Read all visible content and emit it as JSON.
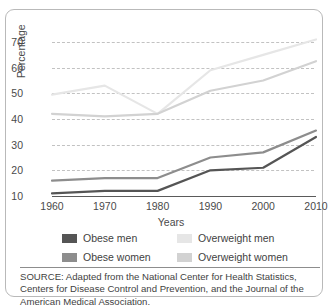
{
  "chart_data": {
    "type": "line",
    "title": "",
    "xlabel": "Years",
    "ylabel": "Percentage",
    "x": [
      1960,
      1970,
      1980,
      1990,
      2000,
      2010
    ],
    "xticklabels": [
      "1960",
      "1970",
      "1980",
      "1990",
      "2000",
      "2010"
    ],
    "yticklabels": [
      "70",
      "60",
      "50",
      "40",
      "30",
      "20",
      "10"
    ],
    "ylim": [
      10,
      73
    ],
    "xlim": [
      1960,
      2010
    ],
    "grid": "horizontal-dashed",
    "legend_position": "below-plot",
    "series": [
      {
        "name": "Obese men",
        "color": "#555555",
        "values": [
          11,
          12,
          12,
          20,
          21,
          33
        ]
      },
      {
        "name": "Obese women",
        "color": "#8d8d8d",
        "values": [
          16,
          17,
          17,
          25,
          27,
          35.5
        ]
      },
      {
        "name": "Overweight men",
        "color": "#e6e6e6",
        "values": [
          49.5,
          53,
          42,
          59,
          65,
          71
        ]
      },
      {
        "name": "Overweight women",
        "color": "#d2d2d2",
        "values": [
          42,
          41,
          42,
          51,
          55,
          62.5
        ]
      }
    ]
  },
  "legend": {
    "items": [
      {
        "label": "Obese men",
        "color": "#555555"
      },
      {
        "label": "Overweight men",
        "color": "#e6e6e6"
      },
      {
        "label": "Obese women",
        "color": "#8d8d8d"
      },
      {
        "label": "Overweight women",
        "color": "#d2d2d2"
      }
    ]
  },
  "source": {
    "text": "SOURCE: Adapted from the National Center for Health Statistics, Centers for Disease Control and Prevention, and the Journal of the American Medical Association."
  }
}
